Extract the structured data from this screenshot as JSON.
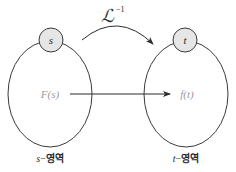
{
  "diagram": {
    "transform_label": {
      "symbol": "ℒ",
      "superscript": "−1"
    },
    "left_domain": {
      "node_label": "s",
      "function_label": "F(s)",
      "caption_var": "s",
      "caption_dash": "−",
      "caption_text": "영역"
    },
    "right_domain": {
      "node_label": "t",
      "function_label": "f(t)",
      "caption_var": "t",
      "caption_dash": "−",
      "caption_text": "영역"
    },
    "colors": {
      "stroke": "#3a3a3a",
      "node_fill": "#e6e6e6",
      "function_label": "#9a9a9a",
      "text": "#2b2b2b"
    }
  }
}
